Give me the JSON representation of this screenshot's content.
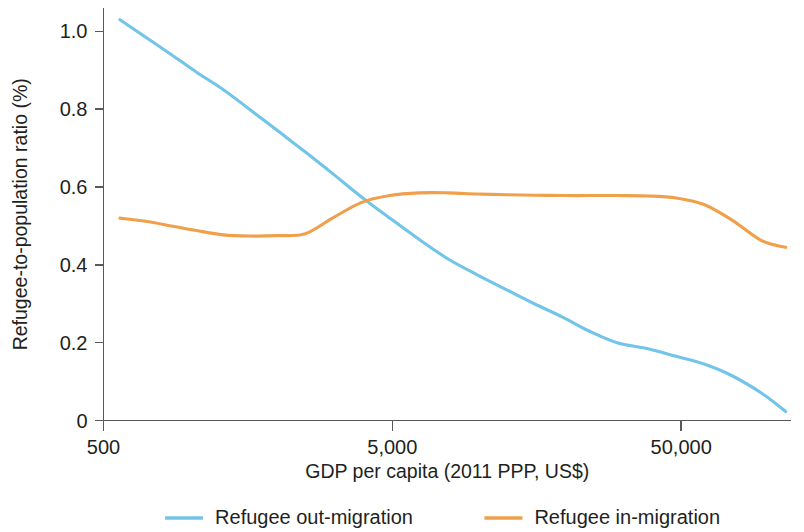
{
  "chart_data": {
    "type": "line",
    "title": "",
    "xlabel": "GDP per capita (2011 PPP, US$)",
    "ylabel": "Refugee-to-population ratio (%)",
    "x_scale": "log",
    "xlim": [
      500,
      120000
    ],
    "ylim": [
      0,
      1.06
    ],
    "xticks": [
      500,
      5000,
      50000
    ],
    "xticklabels": [
      "500",
      "5,000",
      "50,000"
    ],
    "yticks": [
      0,
      0.2,
      0.4,
      0.6,
      0.8,
      1.0
    ],
    "yticklabels": [
      "0",
      "0.2",
      "0.4",
      "0.6",
      "0.8",
      "1.0"
    ],
    "grid": false,
    "legend_position": "bottom",
    "series": [
      {
        "name": "Refugee out-migration",
        "color": "#72c4e8",
        "x": [
          570,
          700,
          860,
          1050,
          1300,
          1600,
          2000,
          2500,
          3100,
          3900,
          4900,
          6200,
          7800,
          9800,
          12500,
          15500,
          19500,
          24000,
          30000,
          38000,
          48000,
          60000,
          75000,
          95000,
          115000
        ],
        "y": [
          1.03,
          0.985,
          0.94,
          0.895,
          0.85,
          0.8,
          0.745,
          0.69,
          0.635,
          0.575,
          0.52,
          0.465,
          0.415,
          0.375,
          0.335,
          0.3,
          0.265,
          0.23,
          0.2,
          0.185,
          0.165,
          0.145,
          0.115,
          0.07,
          0.023
        ]
      },
      {
        "name": "Refugee in-migration",
        "color": "#f0a04b",
        "x": [
          570,
          700,
          860,
          1050,
          1300,
          1600,
          2000,
          2500,
          3100,
          3900,
          4900,
          6200,
          7800,
          9800,
          12500,
          15500,
          19500,
          24000,
          30000,
          38000,
          48000,
          60000,
          75000,
          95000,
          115000
        ],
        "y": [
          0.52,
          0.512,
          0.5,
          0.488,
          0.477,
          0.474,
          0.475,
          0.48,
          0.52,
          0.56,
          0.578,
          0.585,
          0.585,
          0.582,
          0.58,
          0.579,
          0.578,
          0.578,
          0.578,
          0.577,
          0.572,
          0.555,
          0.515,
          0.462,
          0.445
        ]
      }
    ],
    "legend": [
      {
        "label": "Refugee out-migration",
        "color": "#72c4e8"
      },
      {
        "label": "Refugee in-migration",
        "color": "#f0a04b"
      }
    ]
  }
}
